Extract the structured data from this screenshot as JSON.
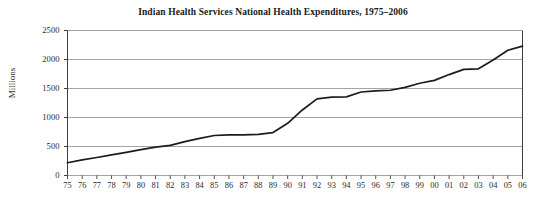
{
  "chart_data": {
    "type": "line",
    "title": "Indian Health Services National Health Expenditures, 1975–2006",
    "xlabel": "",
    "ylabel": "Millions",
    "grid": true,
    "legend": "none",
    "xlim_labels": [
      "75",
      "06"
    ],
    "ylim": [
      0,
      2500
    ],
    "yticks": [
      0,
      500,
      1000,
      1500,
      2000,
      2500
    ],
    "ytick_labels": [
      "0",
      "500",
      "1000",
      "1500",
      "2000",
      "2500"
    ],
    "categories": [
      "75",
      "76",
      "77",
      "78",
      "79",
      "80",
      "81",
      "82",
      "83",
      "84",
      "85",
      "86",
      "87",
      "88",
      "89",
      "90",
      "91",
      "92",
      "93",
      "94",
      "95",
      "96",
      "97",
      "98",
      "99",
      "00",
      "01",
      "02",
      "03",
      "04",
      "05",
      "06"
    ],
    "values": [
      220,
      270,
      310,
      355,
      400,
      445,
      490,
      520,
      585,
      640,
      690,
      700,
      700,
      710,
      740,
      900,
      1130,
      1320,
      1350,
      1355,
      1440,
      1460,
      1470,
      1520,
      1590,
      1640,
      1740,
      1830,
      1840,
      1990,
      2160,
      2230
    ],
    "series": [
      {
        "name": "IHS National Health Expenditures",
        "color": "#1c1c1c",
        "values": [
          220,
          270,
          310,
          355,
          400,
          445,
          490,
          520,
          585,
          640,
          690,
          700,
          700,
          710,
          740,
          900,
          1130,
          1320,
          1350,
          1355,
          1440,
          1460,
          1470,
          1520,
          1590,
          1640,
          1740,
          1830,
          1840,
          1990,
          2160,
          2230
        ]
      }
    ]
  },
  "style": {
    "line_color": "#1c1c1c",
    "grid_color": "#9a9a9a",
    "axis_color": "#3d3d3d",
    "background": "#ffffff"
  }
}
